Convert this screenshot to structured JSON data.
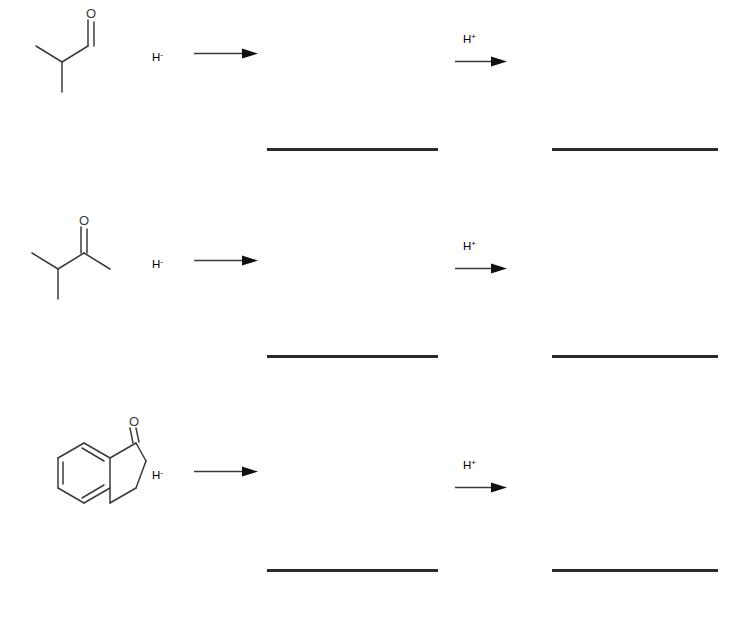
{
  "worksheet": {
    "background_color": "#ffffff",
    "ink_color": "#3a3a3a",
    "blank_line_color": "#2b2b2b",
    "rows": [
      {
        "index": 1,
        "substrate": {
          "name": "2-methylpropanal",
          "common_name": "isobutyraldehyde",
          "formula": "C4H8O",
          "carbonyl_type": "aldehyde",
          "oxygen_label": "O"
        },
        "step1": {
          "reagent_text": "H",
          "reagent_charge": "-",
          "reagent_name": "hydride",
          "arrow": "reaction-arrow-right",
          "label_position": "left-of-arrow"
        },
        "intermediate_blank": "",
        "step2": {
          "reagent_text": "H",
          "reagent_charge": "+",
          "reagent_name": "proton",
          "arrow": "reaction-arrow-right",
          "label_position": "above-arrow"
        },
        "product_blank": ""
      },
      {
        "index": 2,
        "substrate": {
          "name": "3-methylbutan-2-one",
          "common_name": "methyl isopropyl ketone",
          "formula": "C5H10O",
          "carbonyl_type": "ketone",
          "oxygen_label": "O"
        },
        "step1": {
          "reagent_text": "H",
          "reagent_charge": "-",
          "reagent_name": "hydride",
          "arrow": "reaction-arrow-right",
          "label_position": "left-of-arrow"
        },
        "intermediate_blank": "",
        "step2": {
          "reagent_text": "H",
          "reagent_charge": "+",
          "reagent_name": "proton",
          "arrow": "reaction-arrow-right",
          "label_position": "above-arrow"
        },
        "product_blank": ""
      },
      {
        "index": 3,
        "substrate": {
          "name": "3,4-dihydronaphthalen-1(2H)-one",
          "common_name": "1-tetralone",
          "formula": "C10H10O",
          "carbonyl_type": "ketone",
          "oxygen_label": "O"
        },
        "step1": {
          "reagent_text": "H",
          "reagent_charge": "-",
          "reagent_name": "hydride",
          "arrow": "reaction-arrow-right",
          "label_position": "left-of-arrow"
        },
        "intermediate_blank": "",
        "step2": {
          "reagent_text": "H",
          "reagent_charge": "+",
          "reagent_name": "proton",
          "arrow": "reaction-arrow-right",
          "label_position": "above-arrow"
        },
        "product_blank": ""
      }
    ]
  }
}
